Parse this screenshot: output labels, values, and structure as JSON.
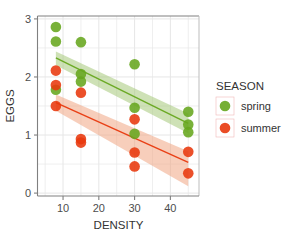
{
  "chart_data": {
    "type": "scatter",
    "title": "",
    "xlabel": "DENSITY",
    "ylabel": "EGGS",
    "xlim": [
      3,
      48
    ],
    "ylim": [
      -0.05,
      3.05
    ],
    "xticks": [
      10,
      20,
      30,
      40
    ],
    "xtick_labels": [
      "10",
      "20",
      "30",
      "40"
    ],
    "yticks": [
      0,
      1,
      2,
      3
    ],
    "ytick_labels": [
      "0",
      "1",
      "2",
      "3"
    ],
    "grid": true,
    "legend": {
      "title": "SEASON",
      "position": "right",
      "entries": [
        {
          "label": "spring",
          "color": "#66a61e"
        },
        {
          "label": "summer",
          "color": "#e8380d"
        }
      ]
    },
    "series": [
      {
        "name": "spring",
        "color": "#66a61e",
        "ribbon_color": "#a5c97a",
        "points": [
          {
            "x": 8,
            "y": 2.86
          },
          {
            "x": 8,
            "y": 2.61
          },
          {
            "x": 8,
            "y": 1.78
          },
          {
            "x": 15,
            "y": 2.6
          },
          {
            "x": 15,
            "y": 2.05
          },
          {
            "x": 15,
            "y": 1.92
          },
          {
            "x": 30,
            "y": 2.22
          },
          {
            "x": 30,
            "y": 1.47
          },
          {
            "x": 30,
            "y": 1.02
          },
          {
            "x": 45,
            "y": 1.4
          },
          {
            "x": 45,
            "y": 1.18
          },
          {
            "x": 45,
            "y": 1.05
          }
        ],
        "fit_line": {
          "x": [
            8,
            45
          ],
          "y": [
            2.33,
            1.2
          ]
        },
        "fit_band_upper": {
          "x": [
            8,
            45
          ],
          "y": [
            2.44,
            1.37
          ]
        },
        "fit_band_lower": {
          "x": [
            8,
            45
          ],
          "y": [
            2.2,
            1.03
          ]
        }
      },
      {
        "name": "summer",
        "color": "#e8380d",
        "ribbon_color": "#f0a584",
        "points": [
          {
            "x": 8,
            "y": 2.11
          },
          {
            "x": 8,
            "y": 1.86
          },
          {
            "x": 8,
            "y": 1.5
          },
          {
            "x": 15,
            "y": 1.73
          },
          {
            "x": 15,
            "y": 0.93
          },
          {
            "x": 15,
            "y": 0.87
          },
          {
            "x": 30,
            "y": 1.27
          },
          {
            "x": 30,
            "y": 0.7
          },
          {
            "x": 30,
            "y": 0.46
          },
          {
            "x": 45,
            "y": 0.71
          },
          {
            "x": 45,
            "y": 0.34
          }
        ],
        "fit_line": {
          "x": [
            8,
            45
          ],
          "y": [
            1.56,
            0.53
          ]
        },
        "fit_band_upper": {
          "x": [
            8,
            45
          ],
          "y": [
            1.7,
            0.72
          ]
        },
        "fit_band_lower": {
          "x": [
            8,
            45
          ],
          "y": [
            1.42,
            0.12
          ]
        }
      }
    ]
  }
}
